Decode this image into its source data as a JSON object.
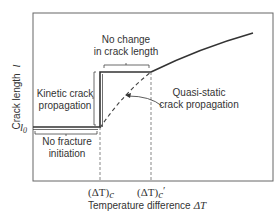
{
  "diagram": {
    "axes": {
      "ylabel": "Crack length",
      "ylabel_symbol": "l",
      "xlabel": "Temperature difference",
      "xlabel_symbol": "ΔT",
      "y_tick": "l",
      "y_tick_sub": "0",
      "x_ticks": [
        {
          "text": "(ΔT)",
          "sub": "c",
          "prime": ""
        },
        {
          "text": "(ΔT)",
          "sub": "c",
          "prime": "′"
        }
      ]
    },
    "annotations": {
      "no_change_line1": "No change",
      "no_change_line2": "in crack length",
      "kinetic_line1": "Kinetic crack",
      "kinetic_line2": "propagation",
      "quasi_line1": "Quasi-static",
      "quasi_line2": "crack propagation",
      "no_fracture_line1": "No fracture",
      "no_fracture_line2": "initiation"
    },
    "colors": {
      "line": "#333333",
      "frame": "#555555",
      "dashed": "#444444"
    }
  }
}
